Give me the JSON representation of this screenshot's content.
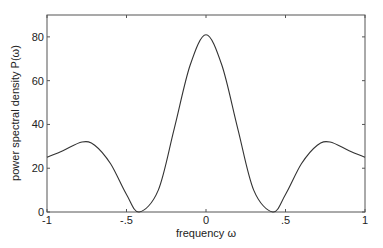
{
  "chart_data": {
    "type": "line",
    "title": "",
    "xlabel": "frequency ω",
    "ylabel": "power spectral density P(ω)",
    "xlim": [
      -1,
      1
    ],
    "ylim": [
      0,
      90
    ],
    "x_ticks": [
      -1,
      -0.5,
      0,
      0.5,
      1
    ],
    "x_tick_labels": [
      "-1",
      "-.5",
      "0",
      ".5",
      "1"
    ],
    "y_ticks": [
      0,
      20,
      40,
      60,
      80
    ],
    "y_tick_labels": [
      "0",
      "20",
      "40",
      "60",
      "80"
    ],
    "grid": false,
    "legend": null,
    "series": [
      {
        "name": "P(ω)",
        "color": "#333333",
        "x": [
          -1,
          -0.9,
          -0.78,
          -0.7,
          -0.6,
          -0.5,
          -0.42,
          -0.3,
          -0.2,
          -0.1,
          0,
          0.1,
          0.2,
          0.3,
          0.42,
          0.5,
          0.6,
          0.7,
          0.78,
          0.9,
          1
        ],
        "y": [
          25,
          28,
          32,
          30.5,
          22,
          8,
          0,
          10,
          38,
          67,
          81,
          67,
          38,
          10,
          0,
          8,
          22,
          30.5,
          32,
          28,
          25
        ]
      }
    ]
  }
}
